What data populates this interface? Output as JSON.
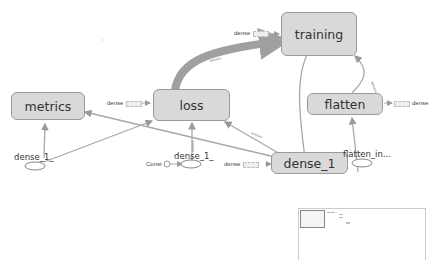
{
  "graph": {
    "nodes": {
      "training": {
        "label": "training"
      },
      "metrics": {
        "label": "metrics"
      },
      "loss": {
        "label": "loss"
      },
      "flatten": {
        "label": "flatten"
      },
      "dense_1": {
        "label": "dense_1"
      }
    },
    "aux_labels": {
      "dense_training": "dense",
      "dense_loss": "dense",
      "dense_flatten": "dense",
      "dense_dense1": "dense",
      "const": "Const"
    },
    "op_labels": {
      "dense_1_left": "dense_1_",
      "dense_1_mid": "dense_1_",
      "flatten_in": "flatten_in..."
    },
    "edge_labels": {
      "loss_training": "tensors",
      "dense1_metrics": "tensors",
      "dense1_loss": "tensors",
      "flatten_training": "tensors"
    },
    "colors": {
      "node_fill": "#d9d9d9",
      "node_border": "#9a9a9a",
      "edge": "#a8a8a8",
      "thick_edge": "#a0a0a0"
    }
  },
  "minimap": {
    "label": "minimap"
  }
}
